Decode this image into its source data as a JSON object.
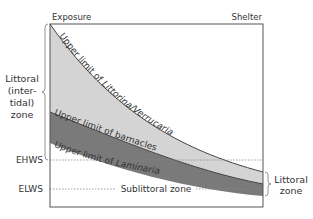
{
  "diagram": {
    "top_left_label": "Exposure",
    "top_right_label": "Shelter",
    "left_zone_label_lines": [
      "Littoral",
      "(inter-",
      "tidal)",
      "zone"
    ],
    "right_zone_label_lines": [
      "Littoral",
      "zone"
    ],
    "ehws_label": "EHWS",
    "elws_label": "ELWS",
    "sublittoral_label": "Sublittoral zone",
    "curve_labels": {
      "littorina": {
        "prefix": "Upper limit of ",
        "italic": "Littorina/Verrucaria"
      },
      "barnacles": {
        "prefix": "Upper limit of barnacles",
        "italic": ""
      },
      "laminaria": {
        "prefix": "Upper limit of ",
        "italic": "Laminaria"
      }
    },
    "colors": {
      "light_band": "#d4d4d4",
      "dark_band": "#7a7a7a",
      "frame": "#555555",
      "text": "#333333"
    }
  }
}
